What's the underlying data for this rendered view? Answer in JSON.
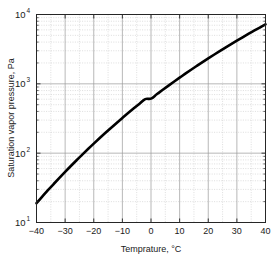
{
  "chart_data": {
    "type": "line",
    "title": "",
    "xlabel": "Temprature, °C",
    "ylabel": "Saturation vapor pressure, Pa",
    "xlim": [
      -40,
      40
    ],
    "ylim": [
      10,
      10000
    ],
    "yscale": "log",
    "xscale": "linear",
    "grid": true,
    "minor_grid": true,
    "legend": "none",
    "xticks": [
      -40,
      -30,
      -20,
      -10,
      0,
      10,
      20,
      30,
      40
    ],
    "xticklabels": [
      "-40",
      "-30",
      "-20",
      "-10",
      "0",
      "10",
      "20",
      "30",
      "40"
    ],
    "yticks": [
      10,
      100,
      1000,
      10000
    ],
    "yticklabels": [
      "10^1",
      "10^2",
      "10^3",
      "10^4"
    ],
    "ytick_base": "10",
    "ytick_exponents": [
      "1",
      "2",
      "3",
      "4"
    ],
    "series": [
      {
        "name": "Saturation vapor pressure",
        "color": "#000000",
        "linewidth": 2.6,
        "x": [
          -40,
          -38,
          -36,
          -34,
          -32,
          -30,
          -28,
          -26,
          -24,
          -22,
          -20,
          -18,
          -16,
          -14,
          -12,
          -10,
          -8,
          -6,
          -4,
          -2,
          0,
          2,
          4,
          6,
          8,
          10,
          12,
          14,
          16,
          18,
          20,
          22,
          24,
          26,
          28,
          30,
          32,
          34,
          36,
          38,
          40
        ],
        "y": [
          19.0,
          23.6,
          29.2,
          35.9,
          44.0,
          53.7,
          65.3,
          79.1,
          95.4,
          114.7,
          137.4,
          164.0,
          195.1,
          231.2,
          273.2,
          321.9,
          378.2,
          443.0,
          517.5,
          602.8,
          611.2,
          705.8,
          813.5,
          935.3,
          1072.7,
          1227.3,
          1401.0,
          1595.6,
          1813.3,
          2056.3,
          2327.0,
          2627.9,
          2961.8,
          3331.6,
          3740.2,
          4191.1,
          4687.8,
          5234.0,
          5833.7,
          6490.7,
          7209.6
        ]
      }
    ]
  },
  "axes": {
    "y_title": "Saturation vapor pressure, Pa",
    "x_title": "Temprature, °C"
  },
  "style": {
    "background": "#ffffff",
    "frame_color": "#262626",
    "major_grid_color": "#9a9a9a",
    "minor_grid_color": "#c8c8c8",
    "curve_color": "#000000"
  }
}
